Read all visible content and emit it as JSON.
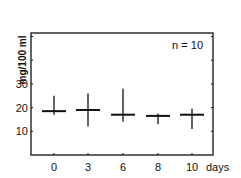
{
  "chart_data": {
    "type": "errorbar",
    "title": "",
    "xlabel": "days",
    "ylabel": "mg/100 ml",
    "annotation": "n = 10",
    "categories": [
      "0",
      "3",
      "6",
      "8",
      "10"
    ],
    "series": [
      {
        "name": "mean",
        "values": [
          18.5,
          19,
          17,
          16.5,
          17
        ],
        "upper": [
          25,
          26,
          28,
          17.5,
          19.5
        ],
        "lower": [
          17,
          12,
          14,
          13,
          11
        ]
      }
    ],
    "yticks": [
      10,
      20,
      30
    ],
    "ylim": [
      0,
      52
    ],
    "grid": false,
    "legend": "none"
  },
  "axis": {
    "x_unit": "days",
    "y_label": "mg/100 ml",
    "y_tick_labels": [
      "10",
      "20",
      "30"
    ],
    "x_tick_labels": [
      "0",
      "3",
      "6",
      "8",
      "10"
    ]
  },
  "annotation": {
    "text": "n = 10"
  }
}
